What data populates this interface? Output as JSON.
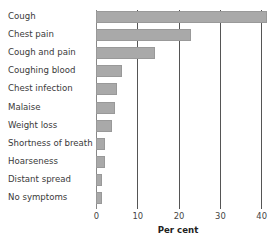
{
  "chart_data": {
    "type": "bar",
    "orientation": "horizontal",
    "title": "",
    "xlabel": "Per cent",
    "ylabel": "",
    "xlim": [
      0,
      42
    ],
    "xticks": [
      0,
      10,
      20,
      30,
      40
    ],
    "grid": true,
    "categories": [
      "Cough",
      "Chest pain",
      "Cough and pain",
      "Coughing blood",
      "Chest infection",
      "Malaise",
      "Weight loss",
      "Shortness of breath",
      "Hoarseness",
      "Distant spread",
      "No symptoms"
    ],
    "values": [
      41.5,
      23,
      14.2,
      6.3,
      5,
      4.6,
      3.8,
      2.3,
      2.2,
      1.5,
      1.4
    ],
    "bar_color": "#a9a9a9"
  },
  "labels": {
    "c0": "Cough",
    "c1": "Chest pain",
    "c2": "Cough and pain",
    "c3": "Coughing blood",
    "c4": "Chest infection",
    "c5": "Malaise",
    "c6": "Weight loss",
    "c7": "Shortness of breath",
    "c8": "Hoarseness",
    "c9": "Distant spread",
    "c10": "No symptoms"
  },
  "ticks": {
    "t0": "0",
    "t1": "10",
    "t2": "20",
    "t3": "30",
    "t4": "40"
  },
  "axis": {
    "xlabel": "Per cent"
  }
}
